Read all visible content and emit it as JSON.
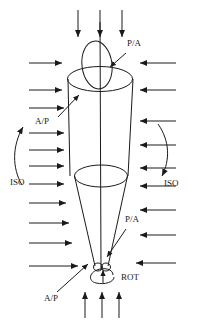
{
  "figure": {
    "width": 201,
    "height": 326,
    "background": "#ffffff",
    "stroke": "#1a1a1a"
  },
  "labels": {
    "pa_top": "P/A",
    "ap_upper": "A/P",
    "iso_left": "ISO",
    "iso_right": "ISO",
    "pa_lower": "P/A",
    "ap_bottom": "A/P",
    "rot": "ROT"
  },
  "label_positions": {
    "pa_top": {
      "x": 128,
      "y": 47
    },
    "ap_upper": {
      "x": 40,
      "y": 123
    },
    "iso_left": {
      "x": 13,
      "y": 182
    },
    "iso_right": {
      "x": 167,
      "y": 182
    },
    "pa_lower": {
      "x": 128,
      "y": 222
    },
    "ap_bottom": {
      "x": 50,
      "y": 300
    },
    "rot": {
      "x": 127,
      "y": 277
    }
  },
  "geometry": {
    "axis_x": 100,
    "axis_top_y": 22,
    "axis_bottom_y": 270,
    "top_ellipse": {
      "cx": 100,
      "cy": 79,
      "rx": 33,
      "ry": 13
    },
    "mid_ellipse": {
      "cx": 101,
      "cy": 176,
      "rx": 26,
      "ry": 11
    },
    "tilted_ellipse": {
      "cx": 97,
      "cy": 66,
      "rx": 15,
      "ry": 24,
      "rotation": -8
    },
    "tip": {
      "cx": 101,
      "cy": 268,
      "rx": 6,
      "ry": 4
    },
    "cylinder_left_x": 68,
    "cylinder_right_x": 133,
    "cone_bottom_left_x": 95,
    "cone_bottom_right_x": 108
  },
  "arrows": {
    "top_down": {
      "count": 3,
      "direction": "down",
      "items": [
        {
          "x": 78,
          "y1": 10,
          "y2": 38
        },
        {
          "x": 100,
          "y1": 10,
          "y2": 38
        },
        {
          "x": 122,
          "y1": 10,
          "y2": 38
        }
      ]
    },
    "bottom_up": {
      "count": 3,
      "direction": "up",
      "items": [
        {
          "x": 85,
          "y1": 318,
          "y2": 292
        },
        {
          "x": 102,
          "y1": 318,
          "y2": 292
        },
        {
          "x": 119,
          "y1": 318,
          "y2": 292
        }
      ]
    },
    "left_right": {
      "count": 10,
      "direction": "right",
      "items": [
        {
          "y": 63,
          "x1": 29,
          "x2": 63
        },
        {
          "y": 90,
          "x1": 29,
          "x2": 63
        },
        {
          "y": 108,
          "x1": 29,
          "x2": 66
        },
        {
          "y": 133,
          "x1": 29,
          "x2": 66
        },
        {
          "y": 150,
          "x1": 29,
          "x2": 66
        },
        {
          "y": 166,
          "x1": 29,
          "x2": 66
        },
        {
          "y": 184,
          "x1": 29,
          "x2": 66
        },
        {
          "y": 203,
          "x1": 29,
          "x2": 68
        },
        {
          "y": 223,
          "x1": 29,
          "x2": 70
        },
        {
          "y": 243,
          "x1": 29,
          "x2": 73
        },
        {
          "y": 266,
          "x1": 29,
          "x2": 80
        }
      ]
    },
    "right_left": {
      "count": 9,
      "direction": "left",
      "items": [
        {
          "y": 63,
          "x1": 174,
          "x2": 138
        },
        {
          "y": 90,
          "x1": 174,
          "x2": 138
        },
        {
          "y": 121,
          "x1": 174,
          "x2": 138
        },
        {
          "y": 145,
          "x1": 174,
          "x2": 138
        },
        {
          "y": 168,
          "x1": 174,
          "x2": 138
        },
        {
          "y": 186,
          "x1": 174,
          "x2": 138
        },
        {
          "y": 210,
          "x1": 174,
          "x2": 138
        },
        {
          "y": 235,
          "x1": 174,
          "x2": 138
        },
        {
          "y": 263,
          "x1": 174,
          "x2": 133
        }
      ]
    },
    "iso_left_curve": {
      "direction": "counterclockwise-up",
      "label": "ISO"
    },
    "iso_right_curve": {
      "direction": "clockwise-down",
      "label": "ISO"
    },
    "rot_loop": {
      "shape": "spiral-loop",
      "label": "ROT"
    },
    "pa_top_leader": {
      "from": {
        "x": 127,
        "y": 52
      },
      "to": {
        "x": 110,
        "y": 68
      }
    },
    "pa_lower_leader": {
      "from": {
        "x": 127,
        "y": 228
      },
      "to": {
        "x": 107,
        "y": 256
      }
    },
    "ap_upper_leader": {
      "from": {
        "x": 58,
        "y": 118
      },
      "to": {
        "x": 78,
        "y": 95
      }
    },
    "ap_bottom_leader": {
      "from": {
        "x": 58,
        "y": 293
      },
      "to": {
        "x": 88,
        "y": 265
      }
    }
  }
}
